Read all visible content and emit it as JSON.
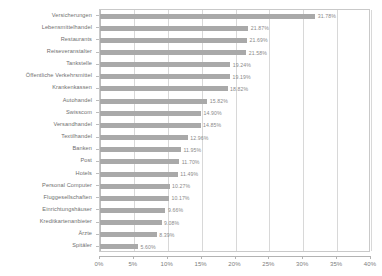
{
  "chart_data": {
    "type": "bar",
    "orientation": "horizontal",
    "title": "",
    "subtitle": "",
    "xlabel": "",
    "ylabel": "",
    "xlim": [
      0,
      40
    ],
    "xtick_labels": [
      "0%",
      "5%",
      "10%",
      "15%",
      "20%",
      "25%",
      "30%",
      "35%",
      "40%"
    ],
    "xticks": [
      0,
      5,
      10,
      15,
      20,
      25,
      30,
      35,
      40
    ],
    "grid": true,
    "grid_axis": "x",
    "legend": false,
    "bar_color": "#a9a9a9",
    "value_suffix": "%",
    "categories": [
      "Versicherungen",
      "Lebensmittelhandel",
      "Restaurants",
      "Reiseveranstalter",
      "Tankstelle",
      "Öffentliche Verkehrsmittel",
      "Krankenkassen",
      "Autohandel",
      "Swisscom",
      "Versandhandel",
      "Textilhandel",
      "Banken",
      "Post",
      "Hotels",
      "Personal Computer",
      "Fluggesellschaften",
      "Einrichtungshäuser",
      "Kreditkartenanbieter",
      "Ärzte",
      "Spitäler"
    ],
    "values": [
      31.78,
      21.87,
      21.69,
      21.58,
      19.24,
      19.19,
      18.82,
      15.82,
      14.9,
      14.85,
      12.96,
      11.95,
      11.7,
      11.49,
      10.27,
      10.17,
      9.66,
      9.08,
      8.39,
      5.6
    ],
    "value_labels": [
      "31.78%",
      "21.87%",
      "21.69%",
      "21.58%",
      "19.24%",
      "19.19%",
      "18.82%",
      "15.82%",
      "14.90%",
      "14.85%",
      "12.96%",
      "11.95%",
      "11.70%",
      "11.49%",
      "10.27%",
      "10.17%",
      "9.66%",
      "9.08%",
      "8.39%",
      "5.60%"
    ]
  }
}
